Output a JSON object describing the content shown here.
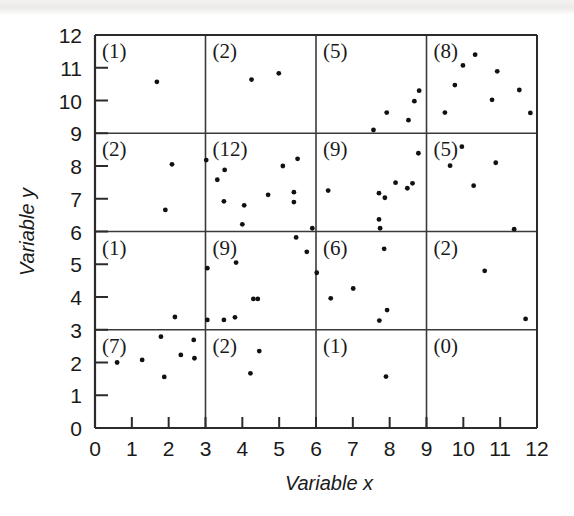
{
  "figure": {
    "title": "",
    "background_color": "#ffffff",
    "point_color": "#111111",
    "line_color": "#2b2b2b"
  },
  "chart_data": {
    "type": "scatter",
    "title": "",
    "subtitle": "",
    "xlabel": "Variable x",
    "ylabel": "Variable y",
    "xlim": [
      0,
      12
    ],
    "ylim": [
      0,
      12
    ],
    "xticks": [
      0,
      1,
      2,
      3,
      4,
      5,
      6,
      7,
      8,
      9,
      10,
      11,
      12
    ],
    "yticks": [
      0,
      1,
      2,
      3,
      4,
      5,
      6,
      7,
      8,
      9,
      10,
      11,
      12
    ],
    "xtick_labels": [
      "0",
      "1",
      "2",
      "3",
      "4",
      "5",
      "6",
      "7",
      "8",
      "9",
      "10",
      "11",
      "12"
    ],
    "ytick_labels": [
      "0",
      "1",
      "2",
      "3",
      "4",
      "5",
      "6",
      "7",
      "8",
      "9",
      "10",
      "11",
      "12"
    ],
    "grid": true,
    "grid_x_lines": [
      3,
      6,
      9
    ],
    "grid_y_lines": [
      3,
      6,
      9
    ],
    "legend": null,
    "legend_position": "none",
    "point_radius": 2.4,
    "cell_counts": [
      {
        "label": "(1)",
        "x_range": [
          0,
          3
        ],
        "y_range": [
          9,
          12
        ],
        "count": 1
      },
      {
        "label": "(2)",
        "x_range": [
          3,
          6
        ],
        "y_range": [
          9,
          12
        ],
        "count": 2
      },
      {
        "label": "(5)",
        "x_range": [
          6,
          9
        ],
        "y_range": [
          9,
          12
        ],
        "count": 5
      },
      {
        "label": "(8)",
        "x_range": [
          9,
          12
        ],
        "y_range": [
          9,
          12
        ],
        "count": 8
      },
      {
        "label": "(2)",
        "x_range": [
          0,
          3
        ],
        "y_range": [
          6,
          9
        ],
        "count": 2
      },
      {
        "label": "(12)",
        "x_range": [
          3,
          6
        ],
        "y_range": [
          6,
          9
        ],
        "count": 12
      },
      {
        "label": "(9)",
        "x_range": [
          6,
          9
        ],
        "y_range": [
          6,
          9
        ],
        "count": 9
      },
      {
        "label": "(5)",
        "x_range": [
          9,
          12
        ],
        "y_range": [
          6,
          9
        ],
        "count": 5
      },
      {
        "label": "(1)",
        "x_range": [
          0,
          3
        ],
        "y_range": [
          3,
          6
        ],
        "count": 1
      },
      {
        "label": "(9)",
        "x_range": [
          3,
          6
        ],
        "y_range": [
          3,
          6
        ],
        "count": 9
      },
      {
        "label": "(6)",
        "x_range": [
          6,
          9
        ],
        "y_range": [
          3,
          6
        ],
        "count": 6
      },
      {
        "label": "(2)",
        "x_range": [
          9,
          12
        ],
        "y_range": [
          3,
          6
        ],
        "count": 2
      },
      {
        "label": "(7)",
        "x_range": [
          0,
          3
        ],
        "y_range": [
          0,
          3
        ],
        "count": 7
      },
      {
        "label": "(2)",
        "x_range": [
          3,
          6
        ],
        "y_range": [
          0,
          3
        ],
        "count": 2
      },
      {
        "label": "(1)",
        "x_range": [
          6,
          9
        ],
        "y_range": [
          0,
          3
        ],
        "count": 1
      },
      {
        "label": "(0)",
        "x_range": [
          9,
          12
        ],
        "y_range": [
          0,
          3
        ],
        "count": 0
      }
    ],
    "points": [
      [
        1.68,
        10.57
      ],
      [
        4.25,
        10.64
      ],
      [
        4.99,
        10.83
      ],
      [
        7.56,
        9.1
      ],
      [
        7.92,
        9.63
      ],
      [
        8.51,
        9.4
      ],
      [
        8.67,
        9.98
      ],
      [
        8.8,
        10.3
      ],
      [
        9.5,
        9.63
      ],
      [
        9.77,
        10.47
      ],
      [
        9.99,
        11.07
      ],
      [
        10.32,
        11.4
      ],
      [
        10.78,
        10.02
      ],
      [
        10.92,
        10.89
      ],
      [
        11.52,
        10.32
      ],
      [
        11.82,
        9.62
      ],
      [
        2.09,
        8.05
      ],
      [
        1.91,
        6.66
      ],
      [
        3.02,
        8.18
      ],
      [
        3.32,
        7.58
      ],
      [
        3.52,
        7.88
      ],
      [
        3.5,
        6.92
      ],
      [
        4.05,
        6.8
      ],
      [
        4.0,
        6.22
      ],
      [
        4.7,
        7.12
      ],
      [
        5.1,
        8.0
      ],
      [
        5.4,
        7.2
      ],
      [
        5.4,
        6.9
      ],
      [
        5.5,
        8.22
      ],
      [
        5.9,
        6.1
      ],
      [
        6.33,
        7.25
      ],
      [
        7.71,
        7.17
      ],
      [
        7.71,
        6.37
      ],
      [
        7.74,
        6.1
      ],
      [
        7.87,
        7.03
      ],
      [
        8.16,
        7.49
      ],
      [
        8.48,
        7.32
      ],
      [
        8.62,
        7.47
      ],
      [
        8.78,
        8.39
      ],
      [
        9.64,
        8.01
      ],
      [
        9.96,
        8.59
      ],
      [
        10.28,
        7.4
      ],
      [
        10.88,
        8.1
      ],
      [
        11.38,
        6.07
      ],
      [
        2.17,
        3.39
      ],
      [
        3.05,
        4.88
      ],
      [
        3.05,
        3.3
      ],
      [
        3.5,
        3.3
      ],
      [
        3.8,
        3.38
      ],
      [
        3.83,
        5.05
      ],
      [
        4.3,
        3.94
      ],
      [
        4.42,
        3.94
      ],
      [
        5.46,
        5.82
      ],
      [
        5.75,
        5.38
      ],
      [
        6.02,
        4.74
      ],
      [
        6.4,
        3.96
      ],
      [
        7.01,
        4.26
      ],
      [
        7.72,
        3.28
      ],
      [
        7.85,
        5.47
      ],
      [
        7.93,
        3.6
      ],
      [
        10.58,
        4.8
      ],
      [
        11.69,
        3.33
      ],
      [
        0.6,
        2.0
      ],
      [
        1.28,
        2.08
      ],
      [
        1.79,
        2.79
      ],
      [
        1.88,
        1.56
      ],
      [
        2.33,
        2.23
      ],
      [
        2.68,
        2.69
      ],
      [
        2.7,
        2.13
      ],
      [
        4.22,
        1.67
      ],
      [
        4.46,
        2.35
      ],
      [
        7.9,
        1.57
      ]
    ]
  }
}
